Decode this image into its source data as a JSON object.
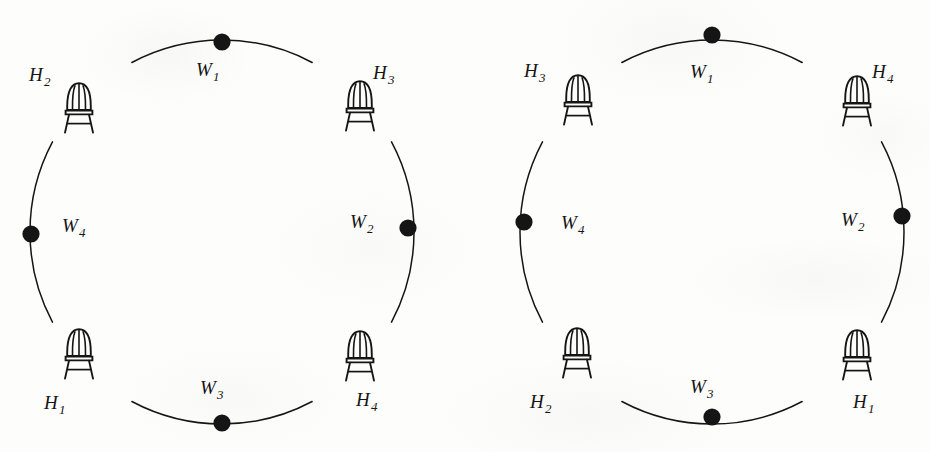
{
  "figure": {
    "type": "diagram",
    "background_color": "#fdfdfc",
    "ink_color": "#151515",
    "diagrams": [
      {
        "id": "left-diagram",
        "name": "left-seating-circle",
        "center": {
          "x": 222,
          "y": 232
        },
        "radius": 192,
        "dot_label_prefix": "W",
        "chair_label_prefix": "H",
        "nodes": [
          {
            "kind": "dot",
            "name": "w1",
            "label": "W",
            "sub": "1",
            "angle_deg": 270,
            "label_x": 196,
            "label_y": 60,
            "dot_x": 222,
            "dot_y": 42
          },
          {
            "kind": "chair",
            "name": "h3",
            "label": "H",
            "sub": "3",
            "angle_deg": 315,
            "label_x": 373,
            "label_y": 63,
            "chair_x": 343,
            "chair_y": 78
          },
          {
            "kind": "dot",
            "name": "w2",
            "label": "W",
            "sub": "2",
            "angle_deg": 0,
            "label_x": 350,
            "label_y": 212,
            "dot_x": 408,
            "dot_y": 228
          },
          {
            "kind": "chair",
            "name": "h4",
            "label": "H",
            "sub": "4",
            "angle_deg": 45,
            "label_x": 356,
            "label_y": 390,
            "chair_x": 343,
            "chair_y": 328
          },
          {
            "kind": "dot",
            "name": "w3",
            "label": "W",
            "sub": "3",
            "angle_deg": 90,
            "label_x": 200,
            "label_y": 378,
            "dot_x": 222,
            "dot_y": 423
          },
          {
            "kind": "chair",
            "name": "h1",
            "label": "H",
            "sub": "1",
            "angle_deg": 135,
            "label_x": 44,
            "label_y": 393,
            "chair_x": 62,
            "chair_y": 326
          },
          {
            "kind": "dot",
            "name": "w4",
            "label": "W",
            "sub": "4",
            "angle_deg": 180,
            "label_x": 62,
            "label_y": 216,
            "dot_x": 31,
            "dot_y": 234
          },
          {
            "kind": "chair",
            "name": "h2",
            "label": "H",
            "sub": "2",
            "angle_deg": 225,
            "label_x": 29,
            "label_y": 65,
            "chair_x": 62,
            "chair_y": 80
          }
        ]
      },
      {
        "id": "right-diagram",
        "name": "right-seating-circle",
        "center": {
          "x": 712,
          "y": 232
        },
        "radius": 192,
        "dot_label_prefix": "W",
        "chair_label_prefix": "H",
        "nodes": [
          {
            "kind": "dot",
            "name": "w1",
            "label": "W",
            "sub": "1",
            "angle_deg": 270,
            "label_x": 690,
            "label_y": 62,
            "dot_x": 712,
            "dot_y": 35
          },
          {
            "kind": "chair",
            "name": "h4",
            "label": "H",
            "sub": "4",
            "angle_deg": 315,
            "label_x": 872,
            "label_y": 62,
            "chair_x": 840,
            "chair_y": 73
          },
          {
            "kind": "dot",
            "name": "w2",
            "label": "W",
            "sub": "2",
            "angle_deg": 0,
            "label_x": 841,
            "label_y": 210,
            "dot_x": 902,
            "dot_y": 216
          },
          {
            "kind": "chair",
            "name": "h1",
            "label": "H",
            "sub": "1",
            "angle_deg": 45,
            "label_x": 853,
            "label_y": 392,
            "chair_x": 840,
            "chair_y": 327
          },
          {
            "kind": "dot",
            "name": "w3",
            "label": "W",
            "sub": "3",
            "angle_deg": 90,
            "label_x": 690,
            "label_y": 377,
            "dot_x": 712,
            "dot_y": 417
          },
          {
            "kind": "chair",
            "name": "h2",
            "label": "H",
            "sub": "2",
            "angle_deg": 135,
            "label_x": 530,
            "label_y": 392,
            "chair_x": 560,
            "chair_y": 325
          },
          {
            "kind": "dot",
            "name": "w4",
            "label": "W",
            "sub": "4",
            "angle_deg": 180,
            "label_x": 561,
            "label_y": 213,
            "dot_x": 524,
            "dot_y": 222
          },
          {
            "kind": "chair",
            "name": "h3",
            "label": "H",
            "sub": "3",
            "angle_deg": 225,
            "label_x": 524,
            "label_y": 61,
            "chair_x": 561,
            "chair_y": 72
          }
        ]
      }
    ]
  }
}
